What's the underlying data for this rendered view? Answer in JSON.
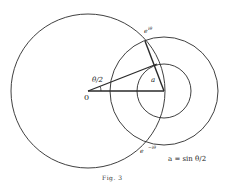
{
  "figure": {
    "caption": "Fig. 3",
    "formula": "a = sin θ/2"
  },
  "labels": {
    "origin": "0",
    "half_angle": "θ/2",
    "radius_a": "a",
    "point_top_base": "e",
    "point_top_sup": "iθ",
    "point_bottom_base": "e",
    "point_bottom_sup": "−iθ"
  },
  "geometry": {
    "big_circle": {
      "cx": 88,
      "cy": 91,
      "r": 77
    },
    "medium_circle": {
      "cx": 164,
      "cy": 91,
      "r": 54
    },
    "small_circle": {
      "cx": 164,
      "cy": 91,
      "r": 27
    },
    "origin": {
      "x": 88,
      "y": 91
    },
    "center": {
      "x": 164,
      "y": 91
    },
    "point_top": {
      "x": 145,
      "y": 41
    },
    "point_bottom": {
      "x": 145,
      "y": 143
    },
    "tangent_point": {
      "x": 157,
      "y": 64
    }
  },
  "colors": {
    "line": "#2a2a2a",
    "background": "#ffffff"
  }
}
